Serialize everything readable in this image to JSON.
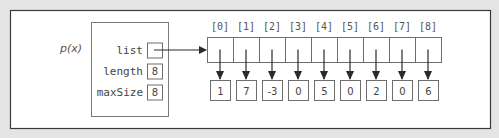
{
  "diagram": {
    "variable_label": "p(x)",
    "struct": {
      "fields": [
        {
          "name": "list",
          "value": "",
          "is_pointer": true
        },
        {
          "name": "length",
          "value": "8"
        },
        {
          "name": "maxSize",
          "value": "8"
        }
      ]
    },
    "array": {
      "indices": [
        "[0]",
        "[1]",
        "[2]",
        "[3]",
        "[4]",
        "[5]",
        "[6]",
        "[7]",
        "[8]"
      ],
      "values": [
        "1",
        "7",
        "-3",
        "0",
        "5",
        "0",
        "2",
        "0",
        "6"
      ]
    },
    "colors": {
      "background": "#e4e4e4",
      "panel": "#ffffff",
      "frame": "#3a3a3a",
      "box_stroke": "#6e6e6e",
      "arrow": "#2a2a2a",
      "text": "#444444",
      "label_text": "#555555"
    }
  }
}
